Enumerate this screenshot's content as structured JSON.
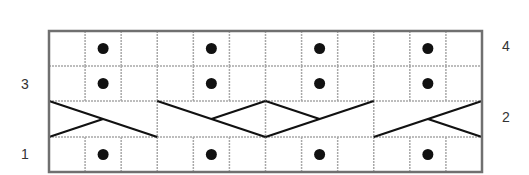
{
  "chart": {
    "columns": 12,
    "rows": 4,
    "stitch_repeat": 3,
    "colors": {
      "border": "#707070",
      "grid": "#a8a8a8",
      "ink": "#111111",
      "background": "#ffffff"
    },
    "row_labels": [
      {
        "row": 4,
        "label": "4",
        "side": "right"
      },
      {
        "row": 3,
        "label": "3",
        "side": "left"
      },
      {
        "row": 2,
        "label": "2",
        "side": "right"
      },
      {
        "row": 1,
        "label": "1",
        "side": "left"
      }
    ],
    "rows_data": [
      {
        "row": 4,
        "type": "purl-dots",
        "dot_columns": [
          2,
          5,
          8,
          11
        ]
      },
      {
        "row": 3,
        "type": "purl-dots",
        "dot_columns": [
          2,
          5,
          8,
          11
        ]
      },
      {
        "row": 2,
        "type": "cable",
        "cables": [
          {
            "columns": [
              1,
              3
            ],
            "long": "top-left to bottom-right",
            "short": "bottom-left to center"
          },
          {
            "columns": [
              4,
              6
            ],
            "long": "top-left to bottom-right",
            "short": "top-right to center"
          },
          {
            "columns": [
              7,
              9
            ],
            "long": "bottom-left to top-right",
            "short": "top-left to center"
          },
          {
            "columns": [
              10,
              12
            ],
            "long": "bottom-left to top-right",
            "short": "bottom-right to center"
          }
        ]
      },
      {
        "row": 1,
        "type": "purl-dots",
        "dot_columns": [
          2,
          5,
          8,
          11
        ]
      }
    ],
    "legend": {
      "dot": "purl-stitch-symbol",
      "empty": "knit-stitch-symbol",
      "crossed-lines": "cable-cross-symbol"
    }
  }
}
